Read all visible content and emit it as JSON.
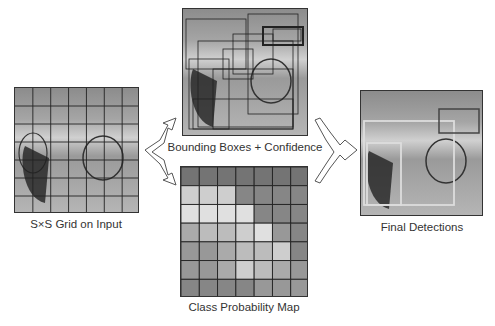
{
  "panels": {
    "input": {
      "caption": "S×S Grid on Input",
      "grid_size": 7
    },
    "boxes": {
      "caption": "Bounding Boxes + Confidence"
    },
    "class_map": {
      "caption": "Class Probability Map",
      "grid_size": 7
    },
    "final": {
      "caption": "Final Detections"
    }
  },
  "colors": {
    "border": "#333333",
    "grid": "#222222",
    "detection_box": "#dddddd"
  },
  "class_map_cells": [
    [
      2,
      2,
      2,
      2,
      2,
      2,
      2
    ],
    [
      7,
      7,
      7,
      3,
      3,
      3,
      3
    ],
    [
      8,
      8,
      8,
      8,
      3,
      3,
      3
    ],
    [
      5,
      6,
      6,
      7,
      8,
      4,
      3
    ],
    [
      4,
      4,
      5,
      6,
      6,
      7,
      3
    ],
    [
      4,
      4,
      5,
      7,
      6,
      5,
      4
    ],
    [
      3,
      3,
      3,
      3,
      4,
      4,
      4
    ]
  ]
}
